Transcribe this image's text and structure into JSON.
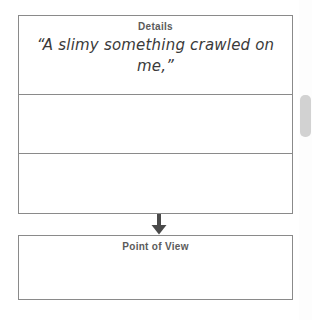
{
  "worksheet": {
    "details_section": {
      "title": "Details",
      "rows": [
        {
          "text": "“A slimy something crawled on me,”"
        },
        {
          "text": ""
        },
        {
          "text": ""
        }
      ]
    },
    "connector": {
      "icon": "arrow-down-icon"
    },
    "pov_section": {
      "title": "Point of View",
      "text": ""
    }
  },
  "scrollbar": {
    "icon": "scrollbar-thumb"
  },
  "colors": {
    "border": "#8a8a8a",
    "heading_text": "#5b5b5b",
    "quote_text": "#3a3a3a",
    "arrow": "#4a4a4a",
    "scrollbar_thumb": "#d2d2d2",
    "background": "#ffffff"
  }
}
